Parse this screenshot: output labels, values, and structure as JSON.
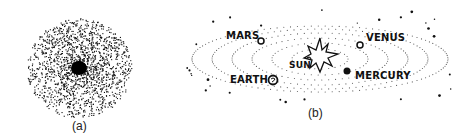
{
  "figure": {
    "panel_a": {
      "caption": "(a)",
      "description": "Dense cloud of dots concentrated at center (nebula)"
    },
    "panel_b": {
      "caption": "(b)",
      "description": "Solar system: Sun with dotted elliptical orbits and planets",
      "labels": {
        "mars": "MARS",
        "venus": "VENUS",
        "sun": "SUN",
        "earth": "EARTH",
        "mercury": "MERCURY"
      }
    }
  }
}
